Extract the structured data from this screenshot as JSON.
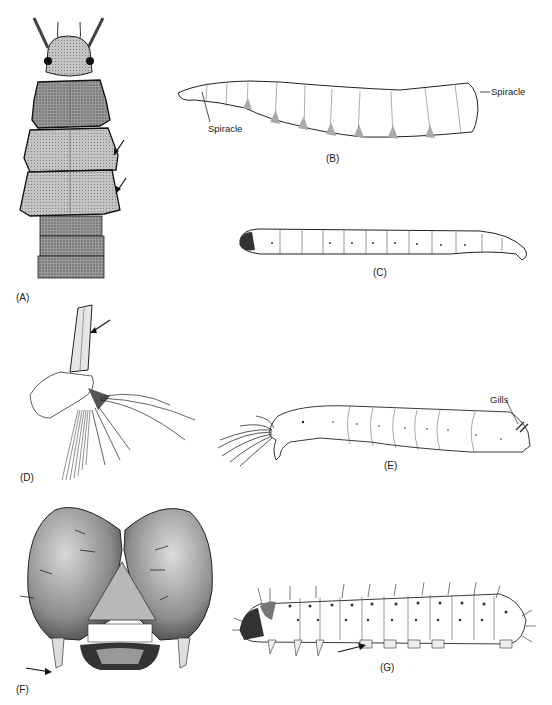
{
  "figure": {
    "panels": [
      {
        "id": "A",
        "label": "(A)",
        "subject": "dorsal view of larva with expanded thoracic lobes",
        "arrows": 2
      },
      {
        "id": "B",
        "label": "(B)",
        "subject": "lateral view of maggot-like larva",
        "annotations": [
          "Spiracle",
          "Spiracle"
        ]
      },
      {
        "id": "C",
        "label": "(C)",
        "subject": "slender segmented wireworm-like larva"
      },
      {
        "id": "D",
        "label": "(D)",
        "subject": "terminal abdominal segment with siphon and setal fan",
        "arrows": 1
      },
      {
        "id": "E",
        "label": "(E)",
        "subject": "aquatic larva with fan-like head brushes",
        "annotations": [
          "Gills"
        ]
      },
      {
        "id": "F",
        "label": "(F)",
        "subject": "frontal view of larval head capsule",
        "arrows": 1
      },
      {
        "id": "G",
        "label": "(G)",
        "subject": "caterpillar with setae and prolegs",
        "arrows": 1
      }
    ]
  },
  "labels": {
    "a": "(A)",
    "b": "(B)",
    "c": "(C)",
    "d": "(D)",
    "e": "(E)",
    "f": "(F)",
    "g": "(G)"
  },
  "annotations": {
    "b_spiracle_left": "Spiracle",
    "b_spiracle_right": "Spiracle",
    "e_gills": "Gills"
  }
}
